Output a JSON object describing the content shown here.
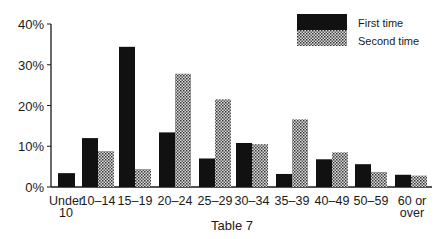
{
  "chart_data": {
    "type": "bar",
    "title": "",
    "caption": "Table 7",
    "xlabel": "",
    "ylabel": "",
    "ylim": [
      0,
      40
    ],
    "yticks": [
      "0%",
      "10%",
      "20%",
      "30%",
      "40%"
    ],
    "grid": false,
    "legend_position": "top-right",
    "categories": [
      "Under 10",
      "10–14",
      "15–19",
      "20–24",
      "25–29",
      "30–34",
      "35–39",
      "40–49",
      "50–59",
      "60 or over"
    ],
    "category_lines": [
      [
        "Under",
        "10"
      ],
      [
        "10–14"
      ],
      [
        "15–19"
      ],
      [
        "20–24"
      ],
      [
        "25–29"
      ],
      [
        "30–34"
      ],
      [
        "35–39"
      ],
      [
        "40–49"
      ],
      [
        "50–59"
      ],
      [
        "60 or",
        "over"
      ]
    ],
    "series": [
      {
        "name": "First time",
        "fill": "solid-black",
        "values": [
          3.4,
          12.0,
          34.4,
          13.4,
          7.0,
          10.8,
          3.2,
          6.8,
          5.6,
          3.0
        ]
      },
      {
        "name": "Second time",
        "fill": "checkered-pattern",
        "values": [
          0,
          8.8,
          4.4,
          27.8,
          21.5,
          10.5,
          16.6,
          8.5,
          3.7,
          2.8
        ]
      }
    ]
  },
  "colors": {
    "first": "#111111",
    "second_dark": "#3a3a3a",
    "second_light": "#d8d8d8",
    "axis": "#1a1a1a"
  }
}
